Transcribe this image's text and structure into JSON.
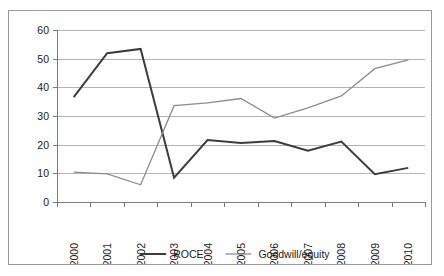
{
  "chart_data": {
    "type": "line",
    "title": "",
    "subtitle": "",
    "xlabel": "",
    "ylabel": "",
    "categories": [
      "2000",
      "2001",
      "2002",
      "2003",
      "2004",
      "2005",
      "2006",
      "2007",
      "2008",
      "2009",
      "2010"
    ],
    "ylim": [
      0,
      60
    ],
    "ytick_labels": [
      "0",
      "10",
      "20",
      "30",
      "40",
      "50",
      "60"
    ],
    "ytick_values": [
      0,
      10,
      20,
      30,
      40,
      50,
      60
    ],
    "grid": true,
    "legend_position": "bottom",
    "series": [
      {
        "name": "ROCE",
        "color": "#3c3c3c",
        "stroke_width": 2.0,
        "values": [
          36.6,
          51.9,
          53.4,
          8.5,
          21.6,
          20.6,
          21.3,
          17.9,
          21.1,
          9.7,
          11.9
        ]
      },
      {
        "name": "Goodwill/equity",
        "color": "#8c8c8c",
        "stroke_width": 1.3,
        "values": [
          10.4,
          9.8,
          6.0,
          33.6,
          34.6,
          36.1,
          29.3,
          32.8,
          37.0,
          46.5,
          49.6
        ]
      }
    ]
  },
  "legend": {
    "items": [
      {
        "label": "ROCE",
        "color": "#3c3c3c",
        "stroke_width": 2.0
      },
      {
        "label": "Goodwill/equity",
        "color": "#8c8c8c",
        "stroke_width": 1.3
      }
    ]
  },
  "colors": {
    "border": "#9a9a9a",
    "gridline": "#b4b4b4",
    "axis": "#7a7a7a",
    "background": "#ffffff",
    "text": "#1a1a1a"
  }
}
